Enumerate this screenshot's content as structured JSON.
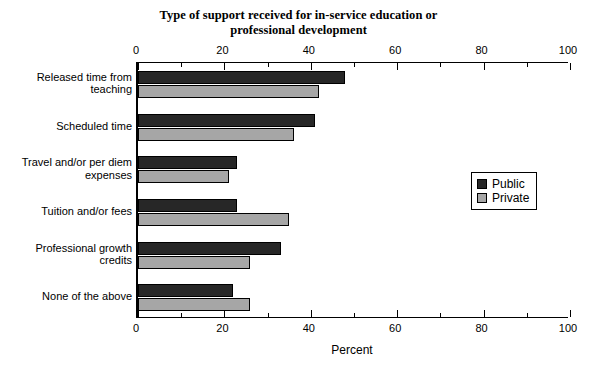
{
  "chart_data": {
    "type": "bar",
    "orientation": "horizontal",
    "title": "Type of support received for in-service education or professional development",
    "title_lines": [
      "Type of support received for in-service education or",
      "professional development"
    ],
    "xlabel": "Percent",
    "ylabel": "",
    "xlim": [
      0,
      100
    ],
    "xticks": [
      0,
      20,
      40,
      60,
      80,
      100
    ],
    "xtick_labels": [
      "0",
      "20",
      "40",
      "60",
      "80",
      "100"
    ],
    "minor_tick_step": 10,
    "grid": false,
    "axis_top": true,
    "axis_bottom": true,
    "legend_position": "center right",
    "categories": [
      "Released time from teaching",
      "Scheduled time",
      "Travel and/or per diem expenses",
      "Tuition and/or fees",
      "Professional growth credits",
      "None of the above"
    ],
    "category_label_lines": [
      [
        "Released time from",
        "teaching"
      ],
      [
        "Scheduled time"
      ],
      [
        "Travel and/or per diem",
        "expenses"
      ],
      [
        "Tuition and/or fees"
      ],
      [
        "Professional growth",
        "credits"
      ],
      [
        "None of the above"
      ]
    ],
    "series": [
      {
        "name": "Public",
        "color": "#272727",
        "values": [
          48,
          41,
          23,
          23,
          33,
          22
        ]
      },
      {
        "name": "Private",
        "color": "#a6a6a6",
        "values": [
          42,
          36,
          21,
          35,
          26,
          26
        ]
      }
    ]
  },
  "legend": {
    "entries": [
      {
        "label": "Public",
        "color": "#272727"
      },
      {
        "label": "Private",
        "color": "#a6a6a6"
      }
    ]
  }
}
